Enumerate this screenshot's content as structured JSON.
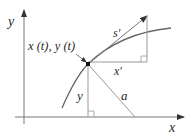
{
  "diagram": {
    "labels": {
      "y_axis": "y",
      "x_axis": "x",
      "point": "x (t), y (t)",
      "s_prime": "s′",
      "x_prime": "x′",
      "y_height": "y",
      "a_segment": "a"
    },
    "colors": {
      "axis": "#555555",
      "curve": "#666666",
      "line": "#8a8a8a",
      "point": "#111111",
      "text": "#2a2a2a"
    }
  }
}
